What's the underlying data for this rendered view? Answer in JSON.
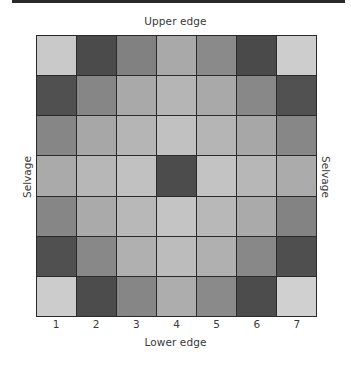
{
  "labels": {
    "upper_edge": "Upper edge",
    "lower_edge": "Lower edge",
    "selvage_left": "Selvage",
    "selvage_right": "Selvage"
  },
  "columns": [
    "1",
    "2",
    "3",
    "4",
    "5",
    "6",
    "7"
  ],
  "grid": {
    "rows": 7,
    "cols": 7,
    "cell_colors": [
      [
        "#c9c9c9",
        "#4b4b4b",
        "#818181",
        "#a9a9a9",
        "#8a8a8a",
        "#4a4a4a",
        "#cdcdcd"
      ],
      [
        "#505050",
        "#868686",
        "#a9a9a9",
        "#b5b5b5",
        "#a9a9a9",
        "#888888",
        "#515151"
      ],
      [
        "#868686",
        "#a7a7a7",
        "#b5b5b5",
        "#c1c1c1",
        "#b5b5b5",
        "#a7a7a7",
        "#878787"
      ],
      [
        "#aaaaaa",
        "#b7b7b7",
        "#c1c1c1",
        "#4c4c4c",
        "#c3c3c3",
        "#b7b7b7",
        "#ababab"
      ],
      [
        "#868686",
        "#aaaaaa",
        "#b8b8b8",
        "#c4c4c4",
        "#b8b8b8",
        "#aaaaaa",
        "#838383"
      ],
      [
        "#505050",
        "#888888",
        "#b0b0b0",
        "#bcbcbc",
        "#b0b0b0",
        "#888888",
        "#4f4f4f"
      ],
      [
        "#cccccc",
        "#4c4c4c",
        "#868686",
        "#adadad",
        "#8a8a8a",
        "#4c4c4c",
        "#d0d0d0"
      ]
    ]
  }
}
